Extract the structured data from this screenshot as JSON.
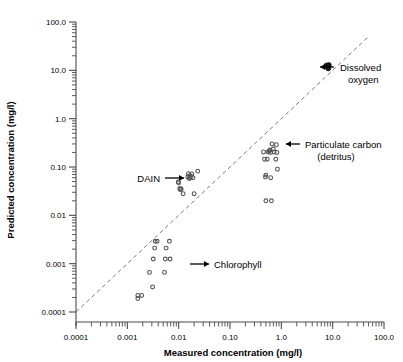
{
  "figure": {
    "background": "#ffffff",
    "point_color": "#555555",
    "solid_point_color": "#111111",
    "axis_color": "#4a4a4a",
    "unity_line_color": "#6b6b6b"
  },
  "chart_data": {
    "type": "scatter",
    "title": "",
    "xlabel": "Measured concentration (mg/l)",
    "ylabel": "Predicted concentration (mg/l)",
    "xscale": "log",
    "yscale": "log",
    "xlim": [
      0.0001,
      100.0
    ],
    "ylim": [
      0.0001,
      100.0
    ],
    "grid": false,
    "legend": "none",
    "xticklabels": [
      "0.0001",
      "0.001",
      "0.01",
      "0.10",
      "1.0",
      "10.0",
      "100.0"
    ],
    "yticklabels": [
      "0.0001",
      "0.001",
      "0.01",
      "0.10",
      "1.0",
      "10.0",
      "100.0"
    ],
    "xtickvalues": [
      0.0001,
      0.001,
      0.01,
      0.1,
      1.0,
      10.0,
      100.0
    ],
    "ytickvalues": [
      0.0001,
      0.001,
      0.01,
      0.1,
      1.0,
      10.0,
      100.0
    ],
    "reference_line": {
      "label": "1:1 line",
      "style": "dashed",
      "from": [
        0.0001,
        0.0001
      ],
      "to": [
        50.0,
        50.0
      ]
    },
    "series": [
      {
        "name": "Chlorophyll",
        "marker": "open-circle",
        "points": [
          [
            0.0016,
            0.00022
          ],
          [
            0.0016,
            0.00019
          ],
          [
            0.0019,
            0.00022
          ],
          [
            0.0027,
            0.00066
          ],
          [
            0.0031,
            0.00033
          ],
          [
            0.0032,
            0.00125
          ],
          [
            0.0034,
            0.0021
          ],
          [
            0.0035,
            0.0029
          ],
          [
            0.0038,
            0.0029
          ],
          [
            0.0053,
            0.00066
          ],
          [
            0.0055,
            0.00125
          ],
          [
            0.0057,
            0.0021
          ],
          [
            0.0066,
            0.0029
          ],
          [
            0.0068,
            0.00125
          ]
        ]
      },
      {
        "name": "DAIN",
        "marker": "open-circle",
        "points": [
          [
            0.0098,
            0.049
          ],
          [
            0.01,
            0.047
          ],
          [
            0.0105,
            0.036
          ],
          [
            0.0108,
            0.034
          ],
          [
            0.0112,
            0.035
          ],
          [
            0.0122,
            0.028
          ],
          [
            0.015,
            0.062
          ],
          [
            0.0155,
            0.073
          ],
          [
            0.016,
            0.058
          ],
          [
            0.0165,
            0.066
          ],
          [
            0.0168,
            0.06
          ],
          [
            0.0175,
            0.064
          ],
          [
            0.018,
            0.072
          ],
          [
            0.019,
            0.06
          ],
          [
            0.02,
            0.028
          ],
          [
            0.0235,
            0.082
          ]
        ]
      },
      {
        "name": "Particulate carbon (detritus)",
        "marker": "open-circle",
        "points": [
          [
            0.45,
            0.205
          ],
          [
            0.47,
            0.145
          ],
          [
            0.49,
            0.062
          ],
          [
            0.5,
            0.068
          ],
          [
            0.5,
            0.02
          ],
          [
            0.53,
            0.145
          ],
          [
            0.55,
            0.205
          ],
          [
            0.58,
            0.215
          ],
          [
            0.6,
            0.225
          ],
          [
            0.62,
            0.2
          ],
          [
            0.62,
            0.06
          ],
          [
            0.64,
            0.02
          ],
          [
            0.66,
            0.3
          ],
          [
            0.7,
            0.235
          ],
          [
            0.72,
            0.205
          ],
          [
            0.78,
            0.145
          ],
          [
            0.8,
            0.29
          ],
          [
            0.82,
            0.2
          ],
          [
            0.84,
            0.09
          ]
        ]
      },
      {
        "name": "Dissolved oxygen",
        "marker": "filled-cluster",
        "points": [
          [
            7.6,
            12.5
          ],
          [
            8.0,
            12.0
          ],
          [
            8.2,
            11.0
          ],
          [
            8.4,
            12.8
          ]
        ]
      }
    ],
    "annotations": [
      {
        "label": "DAIN",
        "target_series": "DAIN",
        "arrow_direction": "right"
      },
      {
        "label": "Chlorophyll",
        "target_series": "Chlorophyll",
        "arrow_direction": "left"
      },
      {
        "label": "Particulate carbon",
        "label_line2": "(detritus)",
        "target_series": "Particulate carbon (detritus)",
        "arrow_direction": "left"
      },
      {
        "label": "Dissolved",
        "label_line2": "oxygen",
        "target_series": "Dissolved oxygen",
        "arrow_direction": "left"
      }
    ]
  }
}
